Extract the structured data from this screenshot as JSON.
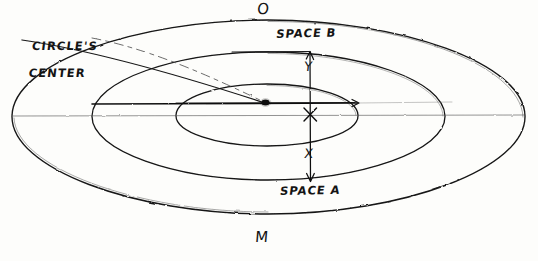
{
  "diagram": {
    "style": "hand-drawn pencil sketch",
    "canvas": {
      "width": 538,
      "height": 261
    },
    "ink_color": "#111111",
    "faint_ink_color": "#6f6f6f",
    "background_color": "#fdfdfb",
    "labels": {
      "circles_center_line1": "CIRCLE'S",
      "circles_center_line2": "CENTER",
      "top_point": "O",
      "bottom_point": "M",
      "space_b": "SPACE B",
      "space_a": "SPACE A",
      "dimension_y": "Y",
      "dimension_x": "X",
      "center_marker": "X"
    },
    "geometry": {
      "center_dot": {
        "x": 265,
        "y": 103
      },
      "cross_marker": {
        "x": 310,
        "y": 115
      },
      "vertical_axis_x": 266,
      "vertical_axis_top_y": 20,
      "vertical_axis_bottom_y": 232,
      "horizontal_chord_y": 103,
      "horizontal_axis_y": 115,
      "dimension_arrow_x": 310,
      "dimension_arrow_top_y": 52,
      "dimension_arrow_bottom_y": 181,
      "ellipses": [
        {
          "name": "outer",
          "cx": 268,
          "cy": 117,
          "rx": 257,
          "ry": 97
        },
        {
          "name": "middle",
          "cx": 268,
          "cy": 116,
          "rx": 177,
          "ry": 64
        },
        {
          "name": "inner",
          "cx": 267,
          "cy": 115,
          "rx": 91,
          "ry": 31
        }
      ],
      "leader_line": {
        "from": {
          "x": 92,
          "y": 38
        },
        "to": {
          "x": 264,
          "y": 102
        }
      }
    }
  }
}
